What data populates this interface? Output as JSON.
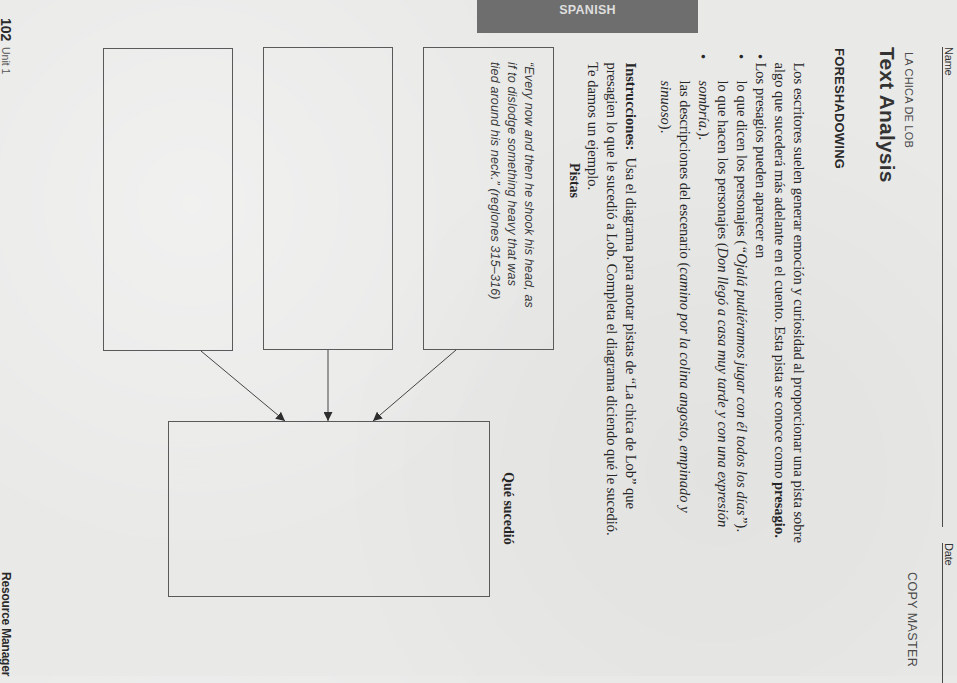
{
  "banner": {
    "label": "SPANISH"
  },
  "header": {
    "name_label": "Name",
    "date_label": "Date",
    "selection_title": "LA CHICA DE LOB",
    "copy_master": "COPY MASTER",
    "title": "Text Analysis"
  },
  "foreshadowing": {
    "heading": "FORESHADOWING",
    "intro": [
      {
        "text": "Los escritores suelen generar emoción y curiosidad al proporcionar una pista sobre"
      },
      {
        "text": "algo que sucederá más adelante en el cuento. Esta pista se conoce como ",
        "term": "presagio."
      },
      {
        "text": "Los presagios pueden aparecer en"
      }
    ],
    "bullet_symbol": "•",
    "bullets": [
      {
        "plain": "lo que dicen los personajes (",
        "italic": "“Ojalá pudiéramos jugar con él todos los días”",
        "after": ")."
      },
      {
        "plain": "lo que hacen los personajes (",
        "italic": "Don llegó a casa muy tarde y con una expresión",
        "cont_italic": "sombría.",
        "cont_after": ")."
      },
      {
        "plain": "las descripciones del escenario (",
        "italic": "camino por la colina angosto, empinado y",
        "cont_italic": "sinuoso",
        "cont_after": ")."
      }
    ]
  },
  "instructions": {
    "label": "Instrucciones:",
    "lines": [
      "  Usa el diagrama para anotar pistas de “La chica de Lob” que",
      "presagien lo que le sucedió a Lob. Completa el diagrama diciendo qué le sucedió.",
      "Te damos un ejemplo."
    ]
  },
  "diagram": {
    "clues_label": "Pistas",
    "result_label": "Qué sucedió",
    "clues": [
      {
        "lines": [
          "“Every now and then he shook his head, as",
          "if to dislodge something heavy that was",
          "tied around his neck.” (reglones 315–316)"
        ]
      },
      {
        "lines": []
      },
      {
        "lines": []
      }
    ],
    "result": {
      "lines": []
    }
  },
  "footer": {
    "page_number": "102",
    "unit": "Unit 1",
    "book": "Resource Manager"
  }
}
